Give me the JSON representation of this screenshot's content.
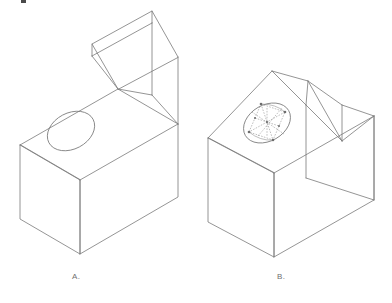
{
  "plate": {
    "title": "Isometric ellipse construction comparison",
    "background_color": "#ffffff",
    "line_color": "#7a7a7a",
    "construction_line_color": "#8a8a8a",
    "width": 392,
    "height": 303
  },
  "figures": [
    {
      "id": "A",
      "label": "A.",
      "description": "Isometric wireframe block with angled top face containing a plain isometric ellipse (hole) and a sloped prism roof",
      "has_construction": false,
      "hole_type": "ellipse"
    },
    {
      "id": "B",
      "label": "B.",
      "description": "Isometric wireframe block with horizontal top face containing an ellipse drawn with four-center construction rhombus, dashed arcs and center points, plus a chevron roof",
      "has_construction": true,
      "hole_type": "ellipse-with-four-center-construction"
    }
  ],
  "annotations": {
    "corner_mark": "black-tick-mark"
  }
}
